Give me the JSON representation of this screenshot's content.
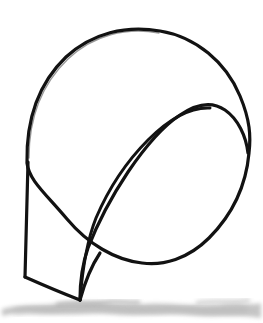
{
  "image": {
    "kind": "hand-drawn-line-sketch",
    "title": "Circle with inner leaf curve and tail",
    "width": 263,
    "height": 323,
    "background_color": "#ffffff",
    "ink_color": "#121212",
    "shadow_color": "#9a9a9a",
    "stroke_width_px": 3
  },
  "strokes": {
    "circle": {
      "name": "outer-circle",
      "center_x": 138,
      "center_y": 146,
      "radius_x": 112,
      "radius_y": 116,
      "rotation_deg": -8,
      "description": "large slightly irregular hand-drawn circle"
    },
    "inner_curve": {
      "name": "inner-leaf-curve",
      "apex_x": 210,
      "apex_y": 108,
      "right_join_x": 248,
      "right_join_y": 152,
      "bottom_end_x": 80,
      "bottom_end_y": 300,
      "description": "curve arcing from upper right down to lower left tail point"
    },
    "tail": {
      "name": "tail-quadrilateral",
      "top_x": 28,
      "top_y": 162,
      "left_x": 25,
      "left_y": 277,
      "bottom_x": 80,
      "bottom_y": 300,
      "description": "narrow quadrilateral flap hanging from lower left of circle"
    },
    "crossing_point": {
      "name": "curve-circle-crossing",
      "x": 100,
      "y": 253
    }
  },
  "shadow": {
    "name": "ground-shadow-smudge",
    "top_y": 298,
    "bottom_y": 320,
    "opacity": 0.45,
    "description": "soft gray pencil smudge across the bottom suggesting ground"
  },
  "labels": {
    "alt_text": "Hand-drawn sketch of a circle with an inner teardrop curve and a flat tail shape resting on a shaded ground line"
  }
}
